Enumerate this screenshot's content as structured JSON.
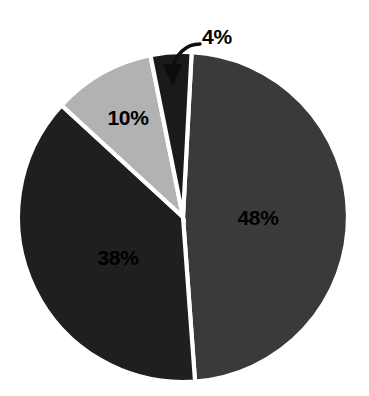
{
  "chart_data": {
    "type": "pie",
    "title": "",
    "subtitle": "",
    "xlabel": "",
    "ylabel": "",
    "legend": "none",
    "grid": false,
    "background_color": "#ffffff",
    "label_color": "#000000",
    "separator_color": "#ffffff",
    "categories": [
      "48%",
      "38%",
      "10%",
      "4%"
    ],
    "values": [
      48,
      38,
      10,
      4
    ],
    "total": 100,
    "units": "percent",
    "start_angle_deg": 3,
    "direction": "clockwise",
    "center": {
      "x": 183,
      "y": 217
    },
    "radius": 165,
    "slices": [
      {
        "label": "48%",
        "value": 48,
        "color": "#3a3a3a",
        "start_deg": 3,
        "end_deg": 175.8,
        "label_x": 258,
        "label_y": 219,
        "label_placement": "inside"
      },
      {
        "label": "38%",
        "value": 38,
        "color": "#1f1f1f",
        "start_deg": 175.8,
        "end_deg": 312.6,
        "label_x": 118,
        "label_y": 259,
        "label_placement": "inside"
      },
      {
        "label": "10%",
        "value": 10,
        "color": "#b2b2b2",
        "start_deg": 312.6,
        "end_deg": 348.6,
        "label_x": 128,
        "label_y": 119,
        "label_placement": "inside"
      },
      {
        "label": "4%",
        "value": 4,
        "color": "#1a1a1a",
        "start_deg": 348.6,
        "end_deg": 363,
        "label_x": 217,
        "label_y": 38,
        "label_placement": "outside",
        "callout": {
          "arrow": true,
          "arrow_color": "#0d0d0d",
          "tip_x": 173,
          "tip_y": 83,
          "from_x": 199,
          "from_y": 44
        }
      }
    ]
  }
}
